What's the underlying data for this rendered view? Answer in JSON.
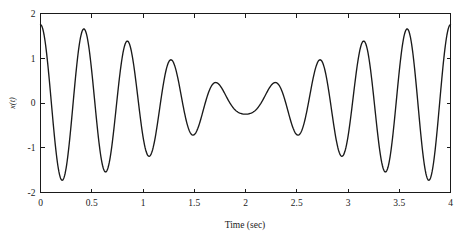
{
  "figure": {
    "background_color": "#ffffff",
    "line_color": "#1a1a1a",
    "axis_color": "#1a1a1a"
  },
  "chart_data": {
    "type": "line",
    "title": "",
    "subtitle": "",
    "xlabel": "Time (sec)",
    "ylabel": "x(t)",
    "xlim": [
      0,
      4
    ],
    "ylim": [
      -2,
      2
    ],
    "grid": false,
    "legend": null,
    "legend_position": "none",
    "x_ticks": [
      0,
      0.5,
      1,
      1.5,
      2,
      2.5,
      3,
      3.5,
      4
    ],
    "x_tick_labels": [
      "0",
      "0.5",
      "1",
      "1.5",
      "2",
      "2.5",
      "3",
      "3.5",
      "4"
    ],
    "y_ticks": [
      -2,
      -1,
      0,
      1,
      2
    ],
    "y_tick_labels": [
      "-2",
      "-1",
      "0",
      "1",
      "2"
    ],
    "tick_direction": "in",
    "box": true,
    "model": {
      "formula": "x(t) = A1*cos(2*pi*f1*t) + A2*cos(2*pi*f2*t)",
      "A1": 1.0,
      "f1": 2.25,
      "A2": 0.75,
      "f2": 2.5,
      "beat_frequency": 0.25,
      "beat_period": 4.0,
      "carrier_frequency": 2.375,
      "envelope_max": 1.75,
      "envelope_min": 0.25
    },
    "series": [
      {
        "name": "x(t)",
        "color": "#1a1a1a",
        "linewidth": 1.35,
        "n_points": 801,
        "key_points": [
          {
            "t": 0.0,
            "x": 1.75
          },
          {
            "t": 0.2,
            "x": -1.6
          },
          {
            "t": 0.4,
            "x": 1.5
          },
          {
            "t": 0.6,
            "x": -1.28
          },
          {
            "t": 0.8,
            "x": 1.17
          },
          {
            "t": 1.0,
            "x": -0.97
          },
          {
            "t": 1.2,
            "x": 0.86
          },
          {
            "t": 1.4,
            "x": -0.66
          },
          {
            "t": 1.6,
            "x": 0.55
          },
          {
            "t": 1.8,
            "x": -0.34
          },
          {
            "t": 2.0,
            "x": 0.22
          },
          {
            "t": 2.2,
            "x": -0.34
          },
          {
            "t": 2.4,
            "x": 0.55
          },
          {
            "t": 2.6,
            "x": -0.66
          },
          {
            "t": 2.8,
            "x": 0.87
          },
          {
            "t": 3.0,
            "x": -0.97
          },
          {
            "t": 3.2,
            "x": 1.18
          },
          {
            "t": 3.4,
            "x": -1.28
          },
          {
            "t": 3.6,
            "x": 1.5
          },
          {
            "t": 3.8,
            "x": -1.6
          },
          {
            "t": 4.0,
            "x": 1.75
          }
        ]
      }
    ]
  }
}
